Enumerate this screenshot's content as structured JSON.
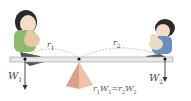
{
  "diagram": {
    "type": "seesaw-torque-balance",
    "labels": {
      "r1": {
        "base": "r",
        "sub": "1"
      },
      "r2": {
        "base": "r",
        "sub": "2"
      },
      "w1": {
        "base": "W",
        "sub": "1"
      },
      "w2": {
        "base": "W",
        "sub": "2"
      }
    },
    "equation": {
      "lhs_r": "r",
      "lhs_r_sub": "1",
      "lhs_w": "W",
      "lhs_w_sub": "1",
      "equals": "=",
      "rhs_r": "r",
      "rhs_r_sub": "2",
      "rhs_w": "W",
      "rhs_w_sub": "2"
    },
    "colors": {
      "board": "#e8e8e8",
      "fulcrum": "#d9a08a",
      "arrow": "#333333",
      "dashed": "#aaaaaa",
      "girl_shirt": "#8fb870",
      "boy_shirt": "#6a8fc0"
    },
    "figures": [
      "girl-with-teddy-left",
      "boy-with-teddy-right"
    ]
  }
}
